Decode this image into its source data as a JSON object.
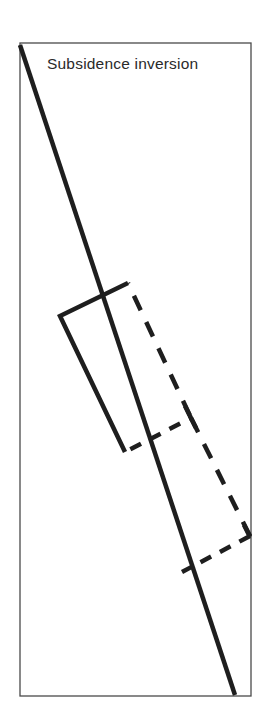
{
  "title": "Subsidence inversion",
  "colors": {
    "ink": "#1e1e1e",
    "frame": "#4a4a4a",
    "background": "#ffffff"
  },
  "diagram": {
    "frame": {
      "x1": 20,
      "y1": 43,
      "x2": 251,
      "y2": 696
    },
    "main_line": {
      "x1": 20,
      "y1": 45,
      "x2": 235,
      "y2": 695
    },
    "solid_parcel": [
      [
        128,
        283
      ],
      [
        60,
        316
      ],
      [
        125,
        452
      ]
    ],
    "dashed_parcel_upper": [
      [
        128,
        283
      ],
      [
        191,
        418
      ],
      [
        125,
        452
      ]
    ],
    "dashed_parcel_lower": [
      [
        191,
        418
      ],
      [
        250,
        536
      ],
      [
        182,
        572
      ]
    ]
  }
}
